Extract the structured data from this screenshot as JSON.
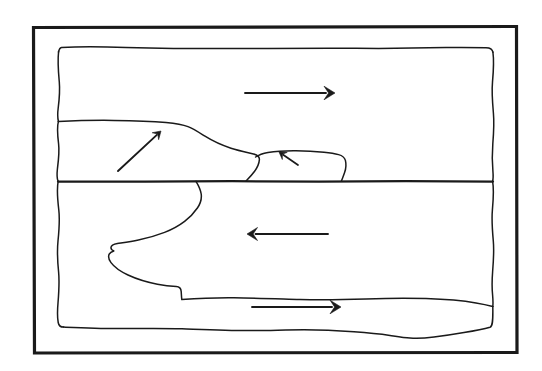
{
  "figure": {
    "kind": "hand-drawn-diagram",
    "width": 542,
    "height": 371,
    "background_color": "#ffffff",
    "ink_color": "#1a1a1a"
  },
  "frame": {
    "outer_border": {
      "name": "outer-rectangle-border",
      "x": 33,
      "y": 26,
      "width": 483,
      "height": 326,
      "stroke_width": 3.2
    },
    "inner_sketch_box": {
      "name": "hand-drawn-inner-box",
      "x": 58,
      "y": 47,
      "width": 435,
      "height": 280,
      "stroke_width": 1.5
    }
  },
  "divider": {
    "name": "central-interface-line",
    "label": "interface",
    "y": 181,
    "x_start": 58,
    "x_end": 493,
    "stroke_width": 2.3
  },
  "regions": [
    {
      "id": "upper-layer",
      "label": "upper layer",
      "y_range": [
        47,
        181
      ]
    },
    {
      "id": "upper-wedge-left",
      "label": "left intruding wedge",
      "tip_x": 255,
      "crest_y": 121
    },
    {
      "id": "upper-wedge-right",
      "label": "right intruding wedge",
      "x_range": [
        255,
        345
      ],
      "crest_y": 152
    },
    {
      "id": "lower-layer",
      "label": "lower layer",
      "y_range": [
        181,
        327
      ]
    },
    {
      "id": "lower-bulge",
      "label": "lower wavy intrusion",
      "x_range": [
        75,
        493
      ],
      "crest_y": 190
    }
  ],
  "arrows": [
    {
      "id": "arrow-upper-right",
      "name": "flow-arrow-upper-right",
      "direction": "right",
      "x1": 245,
      "y1": 93,
      "x2": 335,
      "y2": 93,
      "length": 90
    },
    {
      "id": "arrow-wedge-diagonal",
      "name": "flow-arrow-wedge-up-right",
      "direction": "up-right",
      "x1": 118,
      "y1": 171,
      "x2": 161,
      "y2": 131,
      "length": 59
    },
    {
      "id": "arrow-wedge-small",
      "name": "flow-arrow-small-up-left",
      "direction": "up-left",
      "x1": 298,
      "y1": 165,
      "x2": 279,
      "y2": 152,
      "length": 23
    },
    {
      "id": "arrow-lower-left",
      "name": "flow-arrow-lower-left",
      "direction": "left",
      "x1": 328,
      "y1": 234,
      "x2": 247,
      "y2": 234,
      "length": 81
    },
    {
      "id": "arrow-lower-right",
      "name": "flow-arrow-lower-right",
      "direction": "right",
      "x1": 252,
      "y1": 307,
      "x2": 341,
      "y2": 307,
      "length": 89
    }
  ],
  "annotations": {
    "text_labels": []
  }
}
